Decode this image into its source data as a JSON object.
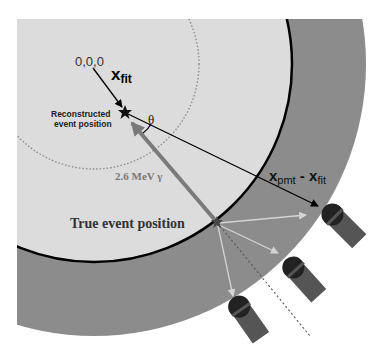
{
  "diagram": {
    "origin_label": "0,0,0",
    "x_fit_label": {
      "main": "x",
      "sub": "fit"
    },
    "reconstructed_label": [
      "Reconstructed",
      "event position"
    ],
    "theta_label": "θ",
    "gamma_label": "2.6 MeV  γ",
    "true_event_label": "True event position",
    "x_pmt_label": {
      "main1": "x",
      "sub1": "pmt",
      "sep": " - ",
      "main2": "x",
      "sub2": "fit"
    }
  },
  "colors": {
    "background": "#ffffff",
    "inner_volume": "#dcdcdc",
    "outer_ring": "#8c8c8c",
    "boundary": "#000000",
    "gamma_arrow": "#6e6e6e",
    "light_rays": "#d0d0d0",
    "pmt_dome": "#222222",
    "pmt_body": "#555555"
  },
  "geometry": {
    "center": [
      94,
      64
    ],
    "inner_radius": 198,
    "outer_radius": 272,
    "dotted_radius": 105,
    "reconstructed_position": [
      125,
      112
    ],
    "true_position": [
      217,
      222
    ],
    "pmts": [
      {
        "dome": [
          331,
          213
        ]
      },
      {
        "dome": [
          292,
          266
        ]
      },
      {
        "dome": [
          238,
          305
        ]
      }
    ]
  }
}
